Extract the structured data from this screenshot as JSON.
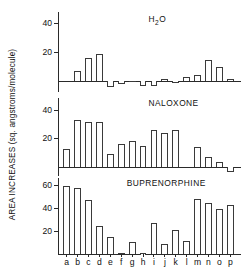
{
  "figure": {
    "ylabel": "AREA INCREASES (sq. angstroms/molecule)",
    "categories": [
      "a",
      "b",
      "c",
      "d",
      "e",
      "f",
      "g",
      "h",
      "i",
      "j",
      "k",
      "l",
      "m",
      "n",
      "o",
      "p"
    ]
  },
  "chart_data": [
    {
      "type": "bar",
      "title": "H 2O",
      "title_display": "H2O",
      "categories": [
        "a",
        "b",
        "c",
        "d",
        "e",
        "f",
        "g",
        "h",
        "i",
        "j",
        "k",
        "l",
        "m",
        "n",
        "o",
        "p"
      ],
      "values": [
        0,
        7,
        16,
        18.5,
        0,
        -4.5,
        -2.5,
        -1,
        -4,
        -4,
        1,
        -2,
        2.5,
        4,
        14.5,
        9.5,
        1,
        0.5
      ],
      "series": [
        {
          "name": "H2O",
          "values": [
            0,
            7,
            16,
            18.5,
            -4.5,
            -2.5,
            -1,
            -4,
            -4,
            1,
            -2,
            2.5,
            4,
            14.5,
            9.5,
            1
          ]
        }
      ],
      "xlabel": "",
      "ylabel": "AREA INCREASES (sq. angstroms/molecule)",
      "ylim": [
        -8,
        48
      ],
      "yticks": [
        20,
        40
      ],
      "ytick_labels": [
        "20",
        "40"
      ],
      "grid": false,
      "legend": "none"
    },
    {
      "type": "bar",
      "title": "NALOXONE",
      "categories": [
        "a",
        "b",
        "c",
        "d",
        "e",
        "f",
        "g",
        "h",
        "i",
        "j",
        "k",
        "l",
        "m",
        "n",
        "o",
        "p"
      ],
      "values": [
        13,
        33,
        31.5,
        31.5,
        9.5,
        16,
        18,
        15,
        26,
        24,
        26,
        0,
        14,
        7.5,
        4,
        -3
      ],
      "series": [
        {
          "name": "NALOXONE",
          "values": [
            13,
            33,
            31.5,
            31.5,
            9.5,
            16,
            18,
            15,
            26,
            24,
            26,
            0,
            14,
            7.5,
            4,
            -3
          ]
        }
      ],
      "xlabel": "",
      "ylabel": "AREA INCREASES (sq. angstroms/molecule)",
      "ylim": [
        -6,
        48
      ],
      "yticks": [
        20,
        40
      ],
      "ytick_labels": [
        "20",
        "40"
      ],
      "grid": false,
      "legend": "none"
    },
    {
      "type": "bar",
      "title": "BUPRENORPHINE",
      "categories": [
        "a",
        "b",
        "c",
        "d",
        "e",
        "f",
        "g",
        "h",
        "i",
        "j",
        "k",
        "l",
        "m",
        "n",
        "o",
        "p"
      ],
      "values": [
        59,
        57,
        47,
        24,
        15,
        1,
        10.5,
        0.5,
        26.5,
        8.5,
        20.5,
        11.5,
        47.5,
        44,
        39.5,
        42.5
      ],
      "series": [
        {
          "name": "BUPRENORPHINE",
          "values": [
            59,
            57,
            47,
            24,
            15,
            1,
            10.5,
            0.5,
            26.5,
            8.5,
            20.5,
            11.5,
            47.5,
            44,
            39.5,
            42.5
          ]
        }
      ],
      "xlabel": "",
      "ylabel": "AREA INCREASES (sq. angstroms/molecule)",
      "ylim": [
        0,
        66
      ],
      "yticks": [
        20,
        40,
        60
      ],
      "ytick_labels": [
        "20",
        "40",
        "60"
      ],
      "grid": false,
      "legend": "none"
    }
  ],
  "panel_geometry": [
    {
      "top": 12,
      "height": 80,
      "baseline_frac": 0.855
    },
    {
      "top": 98,
      "height": 78,
      "baseline_frac": 0.92
    },
    {
      "top": 178,
      "height": 76,
      "baseline_frac": 1.0
    }
  ]
}
